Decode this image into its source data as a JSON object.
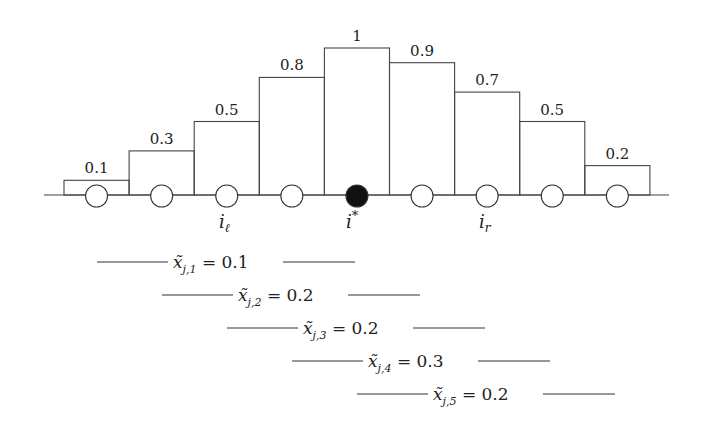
{
  "chart_data": {
    "type": "bar",
    "title": "",
    "categories": [
      "1",
      "2",
      "3",
      "4",
      "5",
      "6",
      "7",
      "8",
      "9"
    ],
    "values": [
      0.1,
      0.3,
      0.5,
      0.8,
      1,
      0.9,
      0.7,
      0.5,
      0.2
    ],
    "value_labels": [
      "0.1",
      "0.3",
      "0.5",
      "0.8",
      "1",
      "0.9",
      "0.7",
      "0.5",
      "0.2"
    ],
    "xlabel": "",
    "ylabel": "",
    "ylim": [
      0,
      1
    ],
    "highlighted_index": 4,
    "index_labels": [
      {
        "position": 2,
        "text": "i_ℓ"
      },
      {
        "position": 4,
        "text": "i*"
      },
      {
        "position": 6,
        "text": "i_r"
      }
    ]
  },
  "labels": {
    "i_left": {
      "base": "i",
      "sub": "ℓ"
    },
    "i_star": {
      "base": "i",
      "sup": "*"
    },
    "i_right": {
      "base": "i",
      "sub": "r"
    }
  },
  "windows": [
    {
      "base": "x̃",
      "sub": "j,1",
      "value": "= 0.1"
    },
    {
      "base": "x̃",
      "sub": "j,2",
      "value": "= 0.2"
    },
    {
      "base": "x̃",
      "sub": "j,3",
      "value": "= 0.2"
    },
    {
      "base": "x̃",
      "sub": "j,4",
      "value": "= 0.3"
    },
    {
      "base": "x̃",
      "sub": "j,5",
      "value": "= 0.2"
    }
  ]
}
